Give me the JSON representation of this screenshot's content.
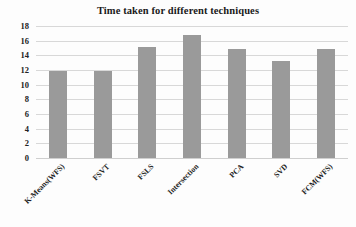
{
  "chart_data": {
    "type": "bar",
    "title": "Time taken for different techniques",
    "xlabel": "",
    "ylabel": "",
    "categories": [
      "K-Means(WFS)",
      "FSVT",
      "FSLS",
      "Intersection",
      "PCA",
      "SVD",
      "FCM(WFS)"
    ],
    "values": [
      11.8,
      11.9,
      15.2,
      16.8,
      14.8,
      13.2,
      14.8
    ],
    "ylim": [
      0,
      18
    ],
    "ytick_step": 2,
    "yticks": [
      18,
      16,
      14,
      12,
      10,
      8,
      6,
      4,
      2,
      0
    ],
    "grid": true,
    "legend": false,
    "bar_color": "#9a9a9a",
    "gridline_color": "#d8d8d8",
    "background_color": "#ffffff",
    "xtick_rotation": -45
  }
}
